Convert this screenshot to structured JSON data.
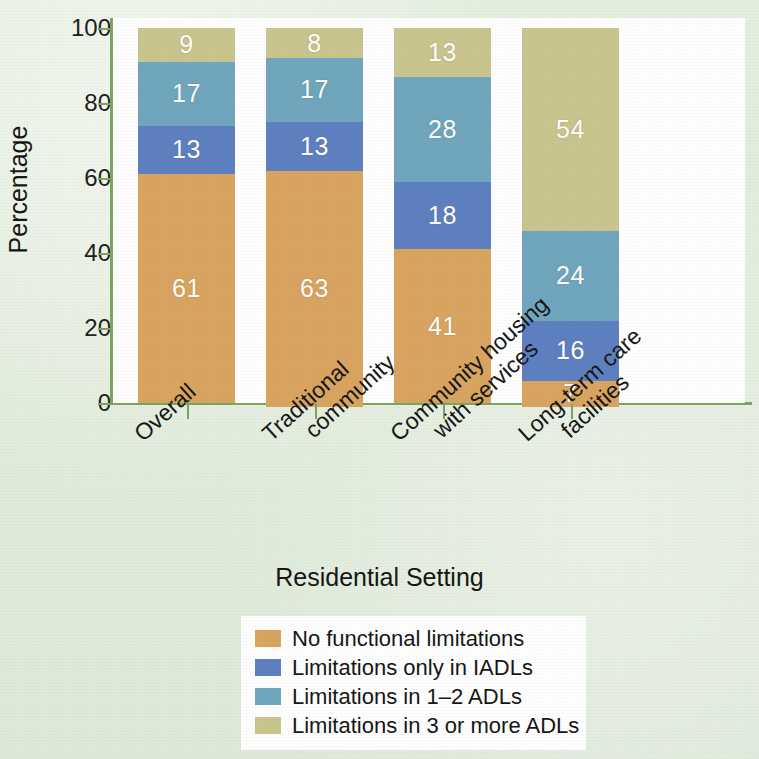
{
  "chart_data": {
    "type": "bar",
    "subtype": "stacked-bar-100-percent",
    "title": "",
    "xlabel": "Residential Setting",
    "ylabel": "Percentage",
    "ylim": [
      0,
      100
    ],
    "yticks": [
      0,
      20,
      40,
      60,
      80,
      100
    ],
    "grid": false,
    "legend_position": "bottom-center",
    "categories": [
      "Overall",
      "Traditional community",
      "Community housing with services",
      "Long-term care facilities"
    ],
    "series": [
      {
        "name": "No functional limitations",
        "color": "#d9a45f",
        "values": [
          61,
          63,
          41,
          7
        ]
      },
      {
        "name": "Limitations only in IADLs",
        "color": "#5d7fc1",
        "values": [
          13,
          13,
          18,
          16
        ]
      },
      {
        "name": "Limitations in 1–2 ADLs",
        "color": "#6fa6be",
        "values": [
          17,
          17,
          28,
          24
        ]
      },
      {
        "name": "Limitations in 3 or more ADLs",
        "color": "#c9c58d",
        "values": [
          9,
          8,
          13,
          54
        ]
      }
    ]
  },
  "axis": {
    "y_title": "Percentage",
    "x_title": "Residential Setting",
    "y_ticks": [
      "100",
      "80",
      "60",
      "40",
      "20",
      "0"
    ]
  },
  "x_labels": [
    {
      "line1": "Overall",
      "line2": ""
    },
    {
      "line1": "Traditional",
      "line2": "community"
    },
    {
      "line1": "Community housing",
      "line2": "with services"
    },
    {
      "line1": "Long-term care",
      "line2": "facilities"
    }
  ],
  "bars": [
    {
      "category": "Overall",
      "segments": [
        {
          "label": "9",
          "value": 9,
          "series": "Limitations in 3 or more ADLs",
          "color": "#c9c58d"
        },
        {
          "label": "17",
          "value": 17,
          "series": "Limitations in 1–2 ADLs",
          "color": "#6fa6be"
        },
        {
          "label": "13",
          "value": 13,
          "series": "Limitations only in IADLs",
          "color": "#5d7fc1"
        },
        {
          "label": "61",
          "value": 61,
          "series": "No functional limitations",
          "color": "#d9a45f"
        }
      ]
    },
    {
      "category": "Traditional community",
      "segments": [
        {
          "label": "8",
          "value": 8,
          "series": "Limitations in 3 or more ADLs",
          "color": "#c9c58d"
        },
        {
          "label": "17",
          "value": 17,
          "series": "Limitations in 1–2 ADLs",
          "color": "#6fa6be"
        },
        {
          "label": "13",
          "value": 13,
          "series": "Limitations only in IADLs",
          "color": "#5d7fc1"
        },
        {
          "label": "63",
          "value": 63,
          "series": "No functional limitations",
          "color": "#d9a45f"
        }
      ]
    },
    {
      "category": "Community housing with services",
      "segments": [
        {
          "label": "13",
          "value": 13,
          "series": "Limitations in 3 or more ADLs",
          "color": "#c9c58d"
        },
        {
          "label": "28",
          "value": 28,
          "series": "Limitations in 1–2 ADLs",
          "color": "#6fa6be"
        },
        {
          "label": "18",
          "value": 18,
          "series": "Limitations only in IADLs",
          "color": "#5d7fc1"
        },
        {
          "label": "41",
          "value": 41,
          "series": "No functional limitations",
          "color": "#d9a45f"
        }
      ]
    },
    {
      "category": "Long-term care facilities",
      "segments": [
        {
          "label": "54",
          "value": 54,
          "series": "Limitations in 3 or more ADLs",
          "color": "#c9c58d"
        },
        {
          "label": "24",
          "value": 24,
          "series": "Limitations in 1–2 ADLs",
          "color": "#6fa6be"
        },
        {
          "label": "16",
          "value": 16,
          "series": "Limitations only in IADLs",
          "color": "#5d7fc1"
        },
        {
          "label": "7",
          "value": 7,
          "series": "No functional limitations",
          "color": "#d9a45f"
        }
      ]
    }
  ],
  "legend": {
    "items": [
      {
        "label": "No functional limitations",
        "color": "#d9a45f"
      },
      {
        "label": "Limitations only in IADLs",
        "color": "#5d7fc1"
      },
      {
        "label": "Limitations in 1–2 ADLs",
        "color": "#6fa6be"
      },
      {
        "label": "Limitations in 3 or more ADLs",
        "color": "#c9c58d"
      }
    ]
  },
  "colors": {
    "background": "#e2eddd",
    "plot_background": "#ffffff",
    "axis": "#7ca35f",
    "text": "#141414",
    "value_label": "#ffffff"
  }
}
